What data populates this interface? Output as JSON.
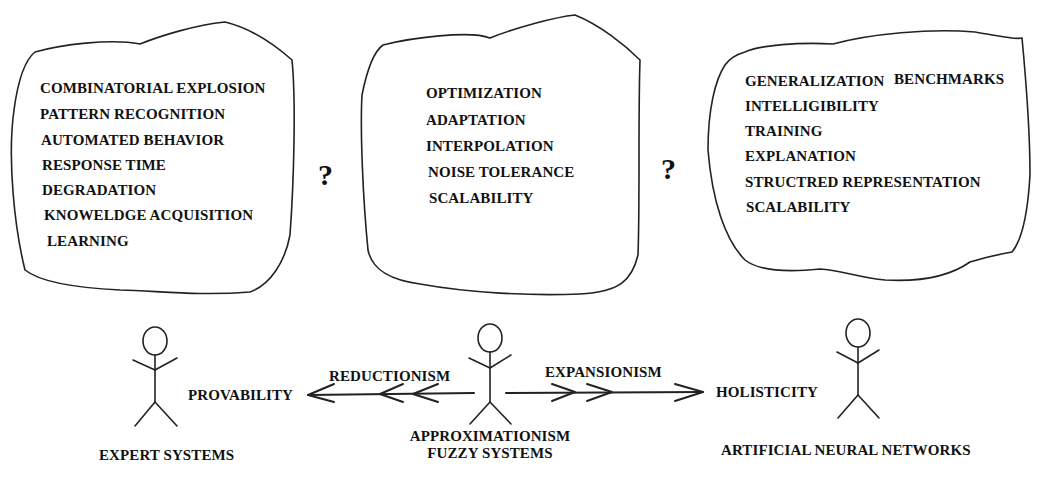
{
  "clouds": {
    "expert": {
      "items": [
        "COMBINATORIAL EXPLOSION",
        "PATTERN RECOGNITION",
        "AUTOMATED BEHAVIOR",
        "RESPONSE TIME",
        "DEGRADATION",
        "KNOWELDGE ACQUISITION",
        "LEARNING"
      ]
    },
    "fuzzy": {
      "items": [
        "OPTIMIZATION",
        "ADAPTATION",
        "INTERPOLATION",
        "NOISE TOLERANCE",
        "SCALABILITY"
      ]
    },
    "neural": {
      "items": [
        "GENERALIZATION",
        "INTELLIGIBILITY",
        "TRAINING",
        "EXPLANATION",
        "STRUCTRED REPRESENTATION",
        "SCALABILITY"
      ],
      "extra": "BENCHMARKS"
    }
  },
  "question_marks": [
    "?",
    "?"
  ],
  "figures": {
    "expert": {
      "label": "EXPERT SYSTEMS",
      "property": "PROVABILITY"
    },
    "fuzzy": {
      "label_line1": "APPROXIMATIONISM",
      "label_line2": "FUZZY SYSTEMS"
    },
    "neural": {
      "label": "ARTIFICIAL NEURAL NETWORKS",
      "property": "HOLISTICITY"
    }
  },
  "arrows": {
    "left": "REDUCTIONISM",
    "right": "EXPANSIONISM"
  }
}
